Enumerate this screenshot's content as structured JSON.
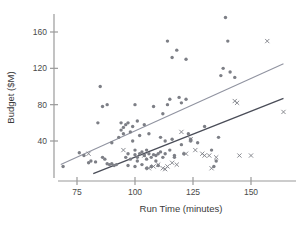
{
  "chart_data": {
    "type": "scatter",
    "title": "",
    "xlabel": "Run Time (minutes)",
    "ylabel": "Budget ($M)",
    "xlim": [
      68,
      168
    ],
    "ylim": [
      0,
      182
    ],
    "xticks": [
      75,
      100,
      125,
      150
    ],
    "yticks": [
      40,
      80,
      120,
      160
    ],
    "xtick_labels": [
      "75",
      "100",
      "125",
      "150"
    ],
    "ytick_labels": [
      "40",
      "80",
      "120",
      "160"
    ],
    "grid": false,
    "legend": "none",
    "series": [
      {
        "name": "dot-group",
        "marker": "dot",
        "color": "#7d7f86",
        "points": [
          [
            69,
            12
          ],
          [
            76,
            27
          ],
          [
            78,
            24
          ],
          [
            80,
            16
          ],
          [
            81,
            18
          ],
          [
            83,
            17
          ],
          [
            84,
            60
          ],
          [
            85,
            100
          ],
          [
            86,
            22
          ],
          [
            86,
            78
          ],
          [
            87,
            20
          ],
          [
            88,
            80
          ],
          [
            88,
            15
          ],
          [
            89,
            14
          ],
          [
            90,
            15
          ],
          [
            90,
            38
          ],
          [
            91,
            13
          ],
          [
            92,
            14
          ],
          [
            93,
            44
          ],
          [
            94,
            52
          ],
          [
            94,
            60
          ],
          [
            95,
            55
          ],
          [
            95,
            48
          ],
          [
            96,
            58
          ],
          [
            96,
            22
          ],
          [
            97,
            26
          ],
          [
            97,
            13
          ],
          [
            97,
            60
          ],
          [
            98,
            50
          ],
          [
            98,
            20
          ],
          [
            99,
            40
          ],
          [
            99,
            56
          ],
          [
            100,
            80
          ],
          [
            100,
            30
          ],
          [
            100,
            25
          ],
          [
            100,
            12
          ],
          [
            101,
            22
          ],
          [
            101,
            62
          ],
          [
            101,
            18
          ],
          [
            102,
            26
          ],
          [
            102,
            46
          ],
          [
            103,
            28
          ],
          [
            103,
            14
          ],
          [
            104,
            24
          ],
          [
            104,
            58
          ],
          [
            105,
            20
          ],
          [
            105,
            30
          ],
          [
            105,
            10
          ],
          [
            106,
            26
          ],
          [
            106,
            48
          ],
          [
            107,
            22
          ],
          [
            107,
            12
          ],
          [
            108,
            25
          ],
          [
            108,
            78
          ],
          [
            109,
            24
          ],
          [
            109,
            18
          ],
          [
            110,
            26
          ],
          [
            110,
            13
          ],
          [
            111,
            44
          ],
          [
            111,
            28
          ],
          [
            112,
            22
          ],
          [
            112,
            70
          ],
          [
            113,
            40
          ],
          [
            113,
            26
          ],
          [
            114,
            150
          ],
          [
            114,
            80
          ],
          [
            115,
            86
          ],
          [
            115,
            30
          ],
          [
            116,
            42
          ],
          [
            116,
            132
          ],
          [
            117,
            24
          ],
          [
            117,
            22
          ],
          [
            118,
            140
          ],
          [
            119,
            88
          ],
          [
            120,
            82
          ],
          [
            120,
            36
          ],
          [
            121,
            26
          ],
          [
            122,
            130
          ],
          [
            122,
            86
          ],
          [
            123,
            48
          ],
          [
            124,
            42
          ],
          [
            124,
            40
          ],
          [
            127,
            38
          ],
          [
            130,
            56
          ],
          [
            133,
            30
          ],
          [
            134,
            12
          ],
          [
            135,
            18
          ],
          [
            136,
            44
          ],
          [
            137,
            112
          ],
          [
            138,
            120
          ],
          [
            139,
            176
          ],
          [
            140,
            150
          ],
          [
            141,
            116
          ],
          [
            143,
            110
          ]
        ]
      },
      {
        "name": "x-group",
        "marker": "x",
        "color": "#7d7f86",
        "points": [
          [
            80,
            26
          ],
          [
            95,
            30
          ],
          [
            104,
            24
          ],
          [
            106,
            10
          ],
          [
            108,
            12
          ],
          [
            110,
            14
          ],
          [
            112,
            10
          ],
          [
            113,
            9
          ],
          [
            114,
            12
          ],
          [
            116,
            16
          ],
          [
            118,
            14
          ],
          [
            120,
            50
          ],
          [
            122,
            26
          ],
          [
            124,
            42
          ],
          [
            126,
            30
          ],
          [
            129,
            26
          ],
          [
            130,
            24
          ],
          [
            132,
            24
          ],
          [
            133,
            10
          ],
          [
            135,
            22
          ],
          [
            143,
            84
          ],
          [
            144,
            82
          ],
          [
            145,
            24
          ],
          [
            150,
            24
          ],
          [
            157,
            150
          ],
          [
            164,
            72
          ]
        ]
      }
    ],
    "trend_lines": [
      {
        "name": "upper-fit",
        "color": "#9093a0",
        "x0": 68,
        "y0": 14,
        "x1": 164,
        "y1": 125
      },
      {
        "name": "lower-fit",
        "color": "#4a4d58",
        "x0": 82,
        "y0": 4,
        "x1": 164,
        "y1": 87
      }
    ]
  }
}
